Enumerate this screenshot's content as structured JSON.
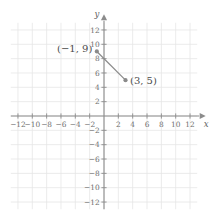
{
  "chart_data": {
    "type": "scatter",
    "title": "",
    "xlabel": "x",
    "ylabel": "y",
    "xlim": [
      -13,
      13
    ],
    "ylim": [
      -13,
      13
    ],
    "grid": true,
    "grid_step": 2,
    "legend": "none",
    "axis_color": "#8c8c8c",
    "grid_color": "#e6e6e6",
    "series_color": "#8a8a8a",
    "x_ticks": [
      -12,
      -10,
      -8,
      -6,
      -4,
      -2,
      2,
      4,
      6,
      8,
      10,
      12
    ],
    "y_ticks": [
      -12,
      -10,
      -8,
      -6,
      -4,
      -2,
      2,
      4,
      6,
      8,
      10,
      12
    ],
    "x_tick_labels": [
      "-12",
      "-10",
      "-8",
      "-6",
      "-4",
      "-2",
      "2",
      "4",
      "6",
      "8",
      "10",
      "12"
    ],
    "y_tick_labels": [
      "-12",
      "-10",
      "-8",
      "-6",
      "-4",
      "-2",
      "2",
      "4",
      "6",
      "8",
      "10",
      "12"
    ],
    "points": [
      {
        "x": -1,
        "y": 9,
        "label": "(−1, 9)",
        "label_side": "left"
      },
      {
        "x": 3,
        "y": 5,
        "label": "(3, 5)",
        "label_side": "right"
      }
    ],
    "segments": [
      {
        "from": [
          -1,
          9
        ],
        "to": [
          3,
          5
        ]
      }
    ],
    "annotations": [
      "(−1, 9)",
      "(3, 5)"
    ]
  },
  "axes": {
    "x_name": "x",
    "y_name": "y",
    "x_arrow": "right",
    "y_arrow": "up"
  },
  "labels": {
    "point_one": "(−1, 9)",
    "point_two": "(3, 5)"
  }
}
